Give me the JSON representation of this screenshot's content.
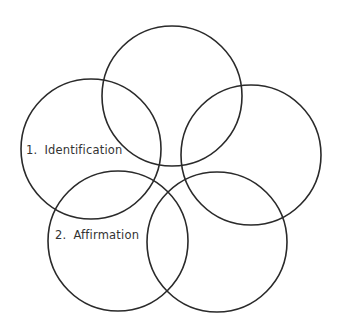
{
  "diagram": {
    "type": "five-overlapping-circles",
    "stroke_color": "#2a2a2a",
    "background_color": "#ffffff",
    "circles": [
      {
        "id": "top",
        "cx": 172,
        "cy": 96,
        "r": 70,
        "label": null
      },
      {
        "id": "left",
        "cx": 91,
        "cy": 149,
        "r": 70,
        "label": {
          "number": "1.",
          "text": "Identification"
        }
      },
      {
        "id": "right",
        "cx": 251,
        "cy": 155,
        "r": 70,
        "label": null
      },
      {
        "id": "bottom-left",
        "cx": 118,
        "cy": 241,
        "r": 70,
        "label": {
          "number": "2.",
          "text": "Affirmation"
        }
      },
      {
        "id": "bottom-right",
        "cx": 217,
        "cy": 242,
        "r": 70,
        "label": null
      }
    ]
  }
}
